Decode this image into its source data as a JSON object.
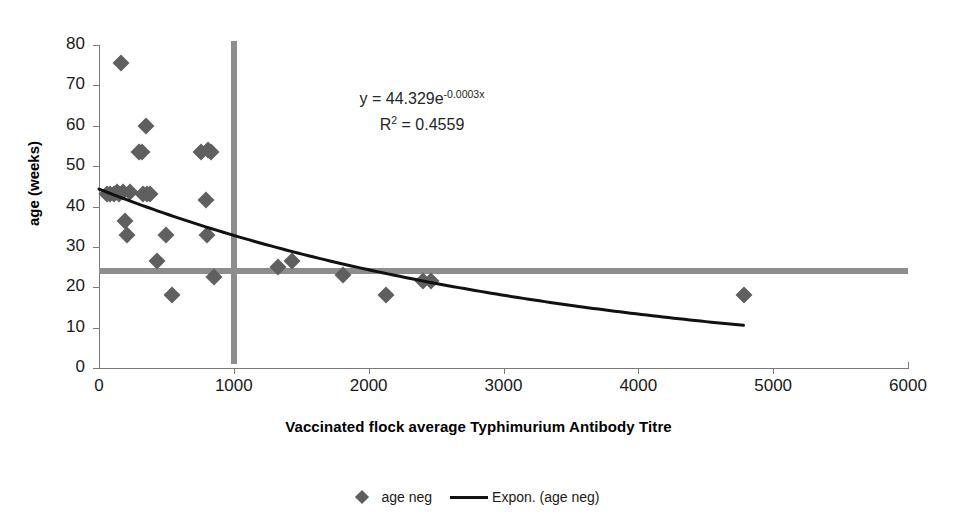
{
  "chart_data": {
    "type": "scatter",
    "title": "",
    "xlabel": "Vaccinated flock average Typhimurium Antibody Titre",
    "ylabel": "age (weeks)",
    "xlim": [
      0,
      6000
    ],
    "ylim": [
      0,
      80
    ],
    "xticks": [
      0,
      1000,
      2000,
      3000,
      4000,
      5000,
      6000
    ],
    "yticks": [
      0,
      10,
      20,
      30,
      40,
      50,
      60,
      70,
      80
    ],
    "grid": false,
    "legend_position": "bottom",
    "series": [
      {
        "name": "age neg",
        "marker": "diamond",
        "color": "#5f5f5f",
        "points": [
          [
            60,
            43
          ],
          [
            85,
            43
          ],
          [
            110,
            43
          ],
          [
            130,
            43.5
          ],
          [
            150,
            43
          ],
          [
            165,
            75.5
          ],
          [
            175,
            43.5
          ],
          [
            195,
            36.5
          ],
          [
            205,
            33
          ],
          [
            230,
            43.5
          ],
          [
            300,
            53.5
          ],
          [
            320,
            53.5
          ],
          [
            330,
            43
          ],
          [
            345,
            60
          ],
          [
            355,
            43
          ],
          [
            380,
            43
          ],
          [
            430,
            26.5
          ],
          [
            500,
            33
          ],
          [
            540,
            18
          ],
          [
            760,
            53.5
          ],
          [
            790,
            41.5
          ],
          [
            800,
            33
          ],
          [
            810,
            54
          ],
          [
            830,
            53.5
          ],
          [
            850,
            22.5
          ],
          [
            1330,
            25
          ],
          [
            1430,
            26.5
          ],
          [
            1810,
            23
          ],
          [
            2130,
            18
          ],
          [
            2400,
            21.5
          ],
          [
            2460,
            21.5
          ],
          [
            4780,
            18
          ]
        ]
      }
    ],
    "trendline": {
      "name": "Expon. (age neg)",
      "type": "exponential",
      "color": "#111111",
      "equation": "y = 44.329e",
      "equation_exponent": "-0.0003x",
      "r_squared_label": "R",
      "r_squared_value": " = 0.4559",
      "r_squared_sup": "2",
      "coefficient": 44.329,
      "rate": -0.0003,
      "r2": 0.4559,
      "x_start": 0,
      "x_end": 4780
    },
    "reference_lines": [
      {
        "orientation": "vertical",
        "value": 1000,
        "color": "#8d8d8d",
        "y_from": 1,
        "y_to": 81
      },
      {
        "orientation": "horizontal",
        "value": 24,
        "color": "#8d8d8d",
        "x_from": 0,
        "x_to": 6000
      }
    ]
  },
  "axes": {
    "x_tick_labels": [
      "0",
      "1000",
      "2000",
      "3000",
      "4000",
      "5000",
      "6000"
    ],
    "y_tick_labels": [
      "0",
      "10",
      "20",
      "30",
      "40",
      "50",
      "60",
      "70",
      "80"
    ],
    "x_title": "Vaccinated flock average Typhimurium Antibody Titre",
    "y_title": "age (weeks)"
  },
  "legend": {
    "entries": [
      {
        "label": "age neg",
        "symbol": "diamond"
      },
      {
        "label": "Expon. (age neg)",
        "symbol": "line"
      }
    ]
  }
}
